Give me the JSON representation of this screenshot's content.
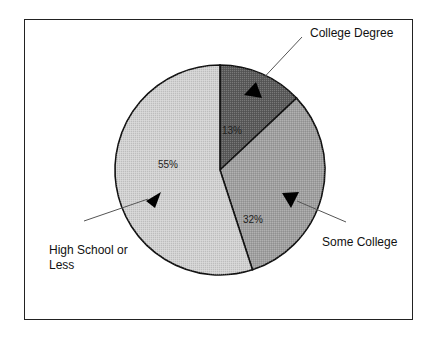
{
  "chart_data": {
    "type": "pie",
    "title": "",
    "start": "12 o'clock, clockwise",
    "slices": [
      {
        "label": "College Degree",
        "value": 13,
        "value_label": "13%",
        "color": "#5a5a5a"
      },
      {
        "label": "Some College",
        "value": 32,
        "value_label": "32%",
        "color": "#a0a0a0"
      },
      {
        "label": "High School or Less",
        "value": 55,
        "value_label": "55%",
        "color": "#d2d2d2"
      }
    ],
    "callouts": [
      {
        "slice": "College Degree",
        "text_lines": [
          "College Degree"
        ]
      },
      {
        "slice": "Some College",
        "text_lines": [
          "Some College"
        ]
      },
      {
        "slice": "High School or Less",
        "text_lines": [
          "High School or",
          "Less"
        ]
      }
    ]
  }
}
